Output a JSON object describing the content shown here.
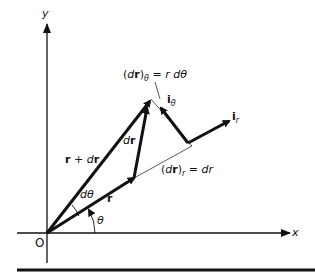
{
  "figure": {
    "type": "polar-coordinate vector diagram",
    "colors": {
      "ink": "#111111",
      "background": "#ffffff"
    },
    "axes": {
      "x_label": "x",
      "y_label": "y",
      "origin_label": "O"
    },
    "vectors": {
      "r": {
        "label": "r"
      },
      "r_plus_dr": {
        "label_bold_r": "r",
        "label_plus": " + ",
        "label_d": "d",
        "label_bold_r2": "r"
      },
      "dr": {
        "label_d": "d",
        "label_r": "r"
      },
      "unit_r": {
        "label": "i",
        "subscript": "r"
      },
      "unit_theta": {
        "label": "i",
        "subscript": "θ"
      }
    },
    "angles": {
      "theta": "θ",
      "dtheta": "dθ"
    },
    "annotations": {
      "dr_theta": {
        "open": "(",
        "d": "d",
        "r": "r",
        "close": ")",
        "subscript": "θ",
        "equals": " = ",
        "rhs": "r dθ"
      },
      "dr_r": {
        "open": "(",
        "d": "d",
        "r": "r",
        "close": ")",
        "subscript": "r",
        "equals": " = ",
        "rhs": "dr"
      }
    }
  }
}
